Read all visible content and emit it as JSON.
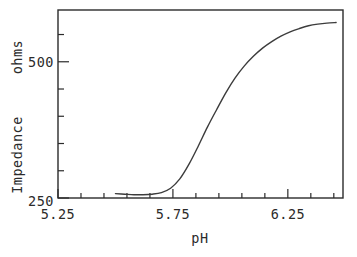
{
  "chart_data": {
    "type": "line",
    "title": "",
    "xlabel": "pH",
    "ylabel": "Impedance   ohms",
    "ylabel_parts": [
      "Impedance",
      "ohms"
    ],
    "xlim": [
      5.25,
      6.49
    ],
    "ylim": [
      250,
      595
    ],
    "grid": false,
    "legend": null,
    "x_major_ticks": [
      5.25,
      5.75,
      6.25
    ],
    "x_major_tick_labels": [
      "5.25",
      "5.75",
      "6.25"
    ],
    "x_minor_tick_step": 0.1,
    "y_major_ticks": [
      250,
      500
    ],
    "y_major_tick_labels": [
      "250",
      "500"
    ],
    "y_minor_ticks": [
      300,
      350,
      400,
      450,
      550
    ],
    "series": [
      {
        "name": "Impedance",
        "color": "#3c3c3c",
        "x": [
          5.5,
          5.54,
          5.58,
          5.62,
          5.66,
          5.7,
          5.74,
          5.78,
          5.82,
          5.86,
          5.9,
          5.94,
          5.98,
          6.02,
          6.06,
          6.1,
          6.14,
          6.18,
          6.22,
          6.26,
          6.3,
          6.34,
          6.38,
          6.42,
          6.46
        ],
        "y": [
          258,
          257,
          256,
          256,
          257,
          260,
          268,
          285,
          312,
          345,
          380,
          412,
          443,
          470,
          492,
          510,
          525,
          537,
          547,
          555,
          561,
          566,
          569,
          571,
          572
        ]
      }
    ]
  },
  "axis_labels": {
    "x_title": "pH",
    "y_title_line1": "Impedance",
    "y_title_line2": "ohms",
    "y_tick_top": "500",
    "y_tick_bottom": "250",
    "x_tick_1": "5.25",
    "x_tick_2": "5.75",
    "x_tick_3": "6.25"
  },
  "style": {
    "line_color": "#3c3c3c",
    "axis_color": "#2b2b2b",
    "background": "#ffffff"
  }
}
